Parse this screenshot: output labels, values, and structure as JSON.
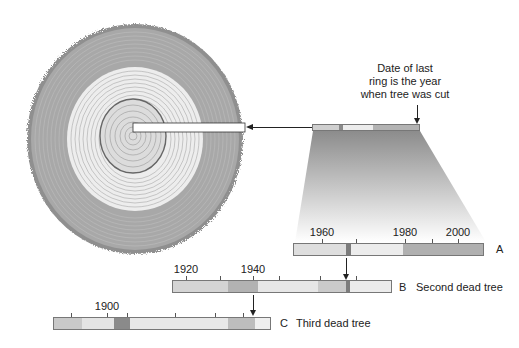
{
  "diagram": {
    "callout": {
      "lines": [
        "Date of last",
        "ring is the year",
        "when tree was cut"
      ]
    },
    "colors": {
      "bark": "#8a8a8a",
      "sapwood": "#a9a9a9",
      "heartwood": "#e8e8e8",
      "dark_band": "#7c7c7c",
      "line": "#222222"
    },
    "samples": [
      {
        "id": "A",
        "letter": "A",
        "description": "",
        "ticks": [
          {
            "label": "1960"
          },
          {
            "label": ""
          },
          {
            "label": "1980"
          },
          {
            "label": ""
          },
          {
            "label": "2000"
          }
        ]
      },
      {
        "id": "B",
        "letter": "B",
        "description": "Second dead tree",
        "ticks": [
          {
            "label": "1920"
          },
          {
            "label": ""
          },
          {
            "label": "1940"
          },
          {
            "label": ""
          },
          {
            "label": ""
          },
          {
            "label": ""
          },
          {
            "label": ""
          }
        ]
      },
      {
        "id": "C",
        "letter": "C",
        "description": "Third dead tree",
        "ticks": [
          {
            "label": ""
          },
          {
            "label": "1900"
          },
          {
            "label": ""
          },
          {
            "label": ""
          },
          {
            "label": ""
          },
          {
            "label": ""
          }
        ]
      }
    ]
  }
}
